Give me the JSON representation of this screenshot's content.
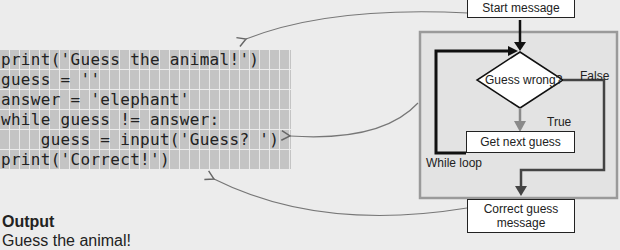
{
  "code": {
    "lines": [
      "print('Guess the animal!')",
      "guess = ''",
      "answer = 'elephant'",
      "while guess != answer:",
      "    guess = input('Guess? ')",
      "print('Correct!')"
    ]
  },
  "flowchart": {
    "start_box": "Start message",
    "decision": "Guess wrong?",
    "false_label": "False",
    "true_label": "True",
    "loop_box": "Get next guess",
    "loop_label": "While loop",
    "end_box": "Correct guess message"
  },
  "output": {
    "title": "Output",
    "first_line": "Guess the animal!"
  }
}
